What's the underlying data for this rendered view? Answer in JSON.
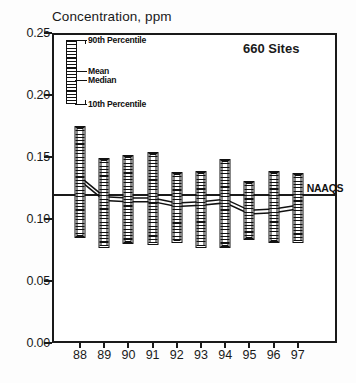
{
  "chart_data": {
    "type": "bar",
    "title": "Concentration, ppm",
    "xlabel": "",
    "ylabel": "Concentration, ppm",
    "categories": [
      "88",
      "89",
      "90",
      "91",
      "92",
      "93",
      "94",
      "95",
      "96",
      "97"
    ],
    "ylim": [
      0.0,
      0.25
    ],
    "ytick_labels": [
      "0.00",
      "0.05",
      "0.10",
      "0.15",
      "0.20",
      "0.25"
    ],
    "ytick_values": [
      0.0,
      0.05,
      0.1,
      0.15,
      0.2,
      0.25
    ],
    "grid": false,
    "legend_position": "upper-left-inset",
    "series": [
      {
        "name": "90th Percentile",
        "values": [
          0.175,
          0.149,
          0.152,
          0.154,
          0.138,
          0.139,
          0.148,
          0.131,
          0.139,
          0.137
        ]
      },
      {
        "name": "10th Percentile",
        "values": [
          0.085,
          0.077,
          0.08,
          0.079,
          0.081,
          0.077,
          0.077,
          0.083,
          0.081,
          0.081
        ]
      },
      {
        "name": "Mean",
        "values": [
          0.134,
          0.118,
          0.117,
          0.117,
          0.113,
          0.114,
          0.116,
          0.107,
          0.108,
          0.111
        ]
      },
      {
        "name": "Median",
        "values": [
          0.131,
          0.115,
          0.114,
          0.114,
          0.11,
          0.111,
          0.113,
          0.104,
          0.105,
          0.108
        ]
      }
    ],
    "annotations": [
      {
        "name": "sites-note",
        "text": "660 Sites"
      },
      {
        "name": "naaqs-label",
        "text": "NAAQS",
        "value": 0.12
      }
    ],
    "legend_entries": [
      {
        "label": "90th Percentile"
      },
      {
        "label": "Mean"
      },
      {
        "label": "Median"
      },
      {
        "label": "10th Percentile"
      }
    ],
    "colors": {
      "ink": "#111111",
      "background": "#ffffff"
    }
  }
}
